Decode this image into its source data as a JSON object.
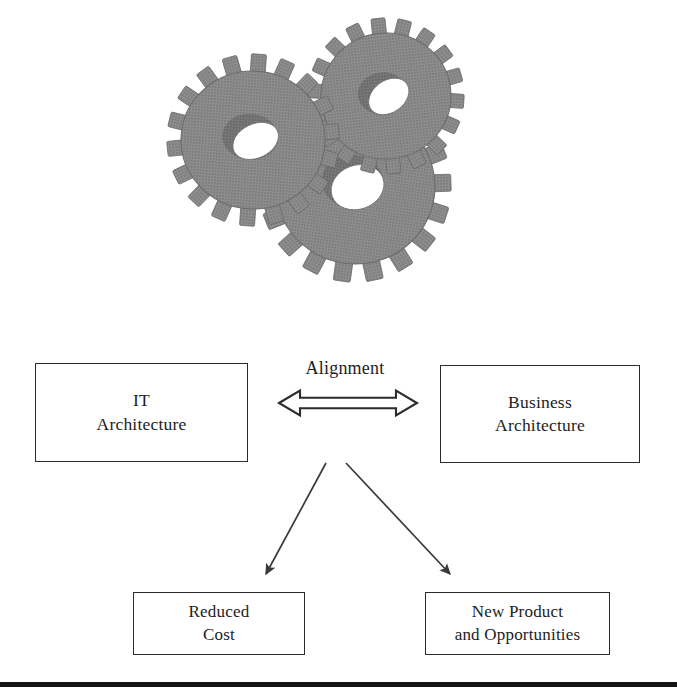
{
  "figure": {
    "kind": "architecture-alignment-diagram",
    "background_color": "#ffffff",
    "width": 677,
    "height": 696
  },
  "illustration": {
    "name": "three-interlocking-gears",
    "gear_count": 3,
    "fill_color": "#8c8c8c",
    "shade_color": "#6f6f6f",
    "edge_color": "#5d5d5d",
    "hole_color": "#ffffff",
    "style": "halftone-dotted-grayscale",
    "gears": [
      {
        "id": "gear-left",
        "teeth": 18,
        "cx": 105,
        "cy": 132,
        "r": 84,
        "hole_rotation": -32
      },
      {
        "id": "gear-top-right",
        "teeth": 18,
        "cx": 235,
        "cy": 88,
        "r": 76,
        "hole_rotation": -32
      },
      {
        "id": "gear-bottom",
        "teeth": 18,
        "cx": 205,
        "cy": 178,
        "r": 93,
        "hole_rotation": -32
      }
    ]
  },
  "nodes": {
    "it_architecture": {
      "id": "it-architecture",
      "label": "IT\nArchitecture",
      "line1": "IT",
      "line2": "Architecture"
    },
    "business_architecture": {
      "id": "business-architecture",
      "label": "Business\nArchitecture",
      "line1": "Business",
      "line2": "Architecture"
    },
    "reduced_cost": {
      "id": "reduced-cost",
      "label": "Reduced\nCost",
      "line1": "Reduced",
      "line2": "Cost"
    },
    "new_product_and_opportunities": {
      "id": "new-product-and-opportunities",
      "label": "New Product\nand Opportunities",
      "line1": "New Product",
      "line2": "and Opportunities"
    }
  },
  "connectors": {
    "alignment": {
      "id": "alignment-arrow",
      "label": "Alignment",
      "style": "hollow-double-headed-horizontal-arrow",
      "from": "it-architecture",
      "to": "business-architecture",
      "stroke_color": "#2b2b2b",
      "fill_color": "#ffffff",
      "x_start": 278,
      "x_end": 418,
      "y": 403
    },
    "to_reduced_cost": {
      "id": "arrow-to-reduced-cost",
      "label": "",
      "style": "thin-line-solid-arrowhead",
      "from": "alignment-arrow",
      "to": "reduced-cost",
      "stroke_color": "#3a3a3a",
      "x1": 326,
      "y1": 463,
      "x2": 264,
      "y2": 577
    },
    "to_new_product": {
      "id": "arrow-to-new-product",
      "label": "",
      "style": "thin-line-solid-arrowhead",
      "from": "alignment-arrow",
      "to": "new-product-and-opportunities",
      "stroke_color": "#3a3a3a",
      "x1": 346,
      "y1": 463,
      "x2": 452,
      "y2": 577
    }
  },
  "decorations": {
    "bottom_rule": {
      "id": "bottom-rule",
      "color": "#141414",
      "thickness_px": 5
    }
  },
  "colors": {
    "box_border": "#2b2b2b",
    "text": "#1d1d1d",
    "gear_gray": "#8c8c8c",
    "rule_black": "#141414"
  }
}
